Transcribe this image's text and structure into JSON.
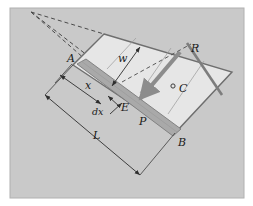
{
  "figure": {
    "type": "engineering-free-body-diagram",
    "canvas": {
      "width": 253,
      "height": 206
    },
    "colors": {
      "background": "#ffffff",
      "panel": "#c9c9c9",
      "panel_border": "#b3b3b3",
      "plate_fill": "#e6e6e6",
      "plate_edge": "#6e6e6e",
      "strip_fill": "#a9a9a9",
      "strip_edge": "#7a7a7a",
      "force_arrow": "#8c8c8c",
      "dimension_line": "#3c3c3c",
      "dashed_line": "#4a4a4a",
      "label_text": "#1a1a1a"
    }
  },
  "labels": {
    "point_a": "A",
    "point_b": "B",
    "point_c": "C",
    "point_e": "E",
    "distance_x": "x",
    "element_dx": "dx",
    "width_w": "w",
    "length_l": "L",
    "pressure_p": "P",
    "resultant_r": "R"
  },
  "annotations": [
    {
      "name": "point-a-label",
      "text": "A",
      "x": 67,
      "y": 62,
      "size": "normal"
    },
    {
      "name": "point-b-label",
      "text": "B",
      "x": 178,
      "y": 146,
      "size": "normal"
    },
    {
      "name": "point-c-label",
      "text": "C",
      "x": 179,
      "y": 92,
      "size": "normal"
    },
    {
      "name": "point-e-label",
      "text": "E",
      "x": 121,
      "y": 111,
      "size": "normal"
    },
    {
      "name": "distance-x-label",
      "text": "x",
      "x": 85,
      "y": 89,
      "size": "normal"
    },
    {
      "name": "element-dx-label",
      "text": "dx",
      "x": 94,
      "y": 113,
      "size": "small"
    },
    {
      "name": "width-w-label",
      "text": "w",
      "x": 120,
      "y": 61,
      "size": "normal"
    },
    {
      "name": "length-l-label",
      "text": "L",
      "x": 95,
      "y": 137,
      "size": "normal"
    },
    {
      "name": "pressure-p-label",
      "text": "P",
      "x": 140,
      "y": 124,
      "size": "normal"
    },
    {
      "name": "resultant-r-label",
      "text": "R",
      "x": 192,
      "y": 51,
      "size": "normal"
    }
  ],
  "geometry": {
    "panel": {
      "x": 10,
      "y": 8,
      "width": 234,
      "height": 190
    },
    "plate_vertices": "104,34 232,72 175,133 73,65",
    "strip_quad": "77,64 86,60 180,130 172,135",
    "apex": {
      "x": 31,
      "y": 12
    },
    "dimension_l": {
      "x1": 45,
      "y1": 95,
      "x2": 140,
      "y2": 175
    },
    "resultant_line": {
      "x1": 187,
      "y1": 43,
      "x2": 222,
      "y2": 95
    },
    "force_arrow": {
      "x1": 180,
      "y1": 52,
      "x2": 136,
      "y2": 104
    }
  }
}
